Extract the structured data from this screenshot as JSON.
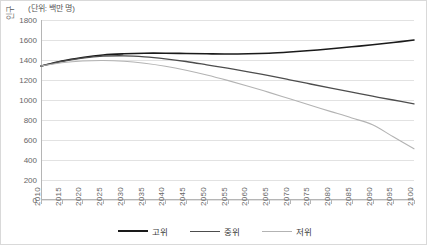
{
  "chart_data": {
    "type": "line",
    "title": "",
    "unit_caption": "(단위: 백만 명)",
    "ylabel": "인구",
    "xlabel": "",
    "x": [
      2010,
      2015,
      2020,
      2025,
      2030,
      2035,
      2040,
      2045,
      2050,
      2055,
      2060,
      2065,
      2070,
      2075,
      2080,
      2085,
      2090,
      2095,
      2100
    ],
    "xticklabels": [
      "2010",
      "2015",
      "2020",
      "2025",
      "2030",
      "2035",
      "2040",
      "2045",
      "2050",
      "2055",
      "2060",
      "2065",
      "2070",
      "2075",
      "2080",
      "2085",
      "2090",
      "2095",
      "2100"
    ],
    "yticks": [
      0,
      200,
      400,
      600,
      800,
      1000,
      1200,
      1400,
      1600,
      1800
    ],
    "yticklabels": [
      "0",
      "200",
      "400",
      "600",
      "800",
      "1000",
      "1200",
      "1400",
      "1600",
      "1800"
    ],
    "ylim": [
      0,
      1800
    ],
    "xlim": [
      2010,
      2100
    ],
    "grid": true,
    "legend_position": "bottom",
    "series": [
      {
        "name": "고위",
        "color": "#1a1a1a",
        "width": 1.6,
        "values": [
          1340,
          1390,
          1425,
          1450,
          1462,
          1468,
          1468,
          1465,
          1462,
          1460,
          1462,
          1468,
          1480,
          1495,
          1512,
          1532,
          1552,
          1575,
          1600
        ]
      },
      {
        "name": "중위",
        "color": "#4d4d4d",
        "width": 1.3,
        "values": [
          1340,
          1385,
          1418,
          1438,
          1442,
          1432,
          1412,
          1385,
          1352,
          1318,
          1282,
          1243,
          1202,
          1160,
          1118,
          1078,
          1038,
          1000,
          962
        ]
      },
      {
        "name": "저위",
        "color": "#b3b3b3",
        "width": 1.1,
        "values": [
          1340,
          1372,
          1390,
          1395,
          1388,
          1368,
          1338,
          1298,
          1250,
          1196,
          1138,
          1076,
          1012,
          948,
          884,
          820,
          752,
          632,
          512
        ]
      }
    ]
  }
}
